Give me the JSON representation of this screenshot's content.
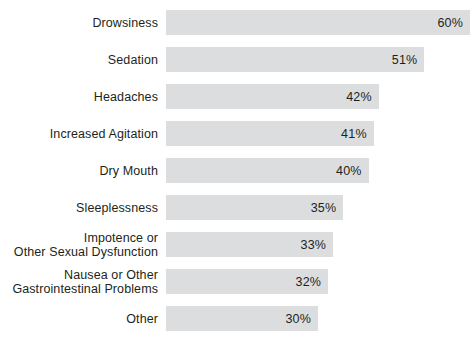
{
  "chart_data": {
    "type": "bar",
    "orientation": "horizontal",
    "title": "",
    "xlabel": "",
    "ylabel": "",
    "xlim": [
      0,
      60
    ],
    "grid": false,
    "legend": null,
    "value_suffix": "%",
    "bar_color": "#dcdddf",
    "text_color": "#231f20",
    "background_color": "#ffffff",
    "categories": [
      "Drowsiness",
      "Sedation",
      "Headaches",
      "Increased Agitation",
      "Dry Mouth",
      "Sleeplessness",
      "Impotence or\nOther Sexual Dysfunction",
      "Nausea or Other\nGastrointestinal Problems",
      "Other"
    ],
    "values": [
      60,
      51,
      42,
      41,
      40,
      35,
      33,
      32,
      30
    ],
    "value_labels": [
      "60%",
      "51%",
      "42%",
      "41%",
      "40%",
      "35%",
      "33%",
      "32%",
      "30%"
    ],
    "bars": [
      {
        "label": "Drowsiness",
        "value": 60,
        "value_label": "60%"
      },
      {
        "label": "Sedation",
        "value": 51,
        "value_label": "51%"
      },
      {
        "label": "Headaches",
        "value": 42,
        "value_label": "42%"
      },
      {
        "label": "Increased Agitation",
        "value": 41,
        "value_label": "41%"
      },
      {
        "label": "Dry Mouth",
        "value": 40,
        "value_label": "40%"
      },
      {
        "label": "Sleeplessness",
        "value": 35,
        "value_label": "35%"
      },
      {
        "label": "Impotence or\nOther Sexual Dysfunction",
        "value": 33,
        "value_label": "33%"
      },
      {
        "label": "Nausea or Other\nGastrointestinal Problems",
        "value": 32,
        "value_label": "32%"
      },
      {
        "label": "Other",
        "value": 30,
        "value_label": "30%"
      }
    ]
  }
}
